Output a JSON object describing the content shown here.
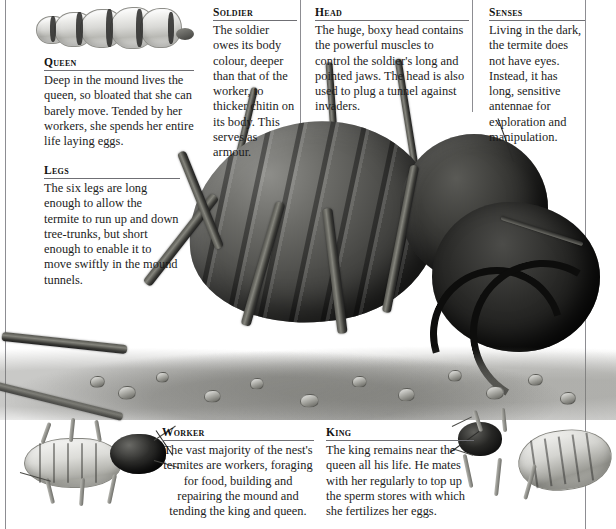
{
  "page": {
    "background_color": "#ffffff",
    "rule_color": "#8d8d92",
    "text_color": "#1c1c1c"
  },
  "captions": [
    {
      "id": "queen",
      "heading": "Queen",
      "body": "Deep in the mound lives the queen, so bloated that she can barely move. Tended by her workers, she spends her entire life laying eggs."
    },
    {
      "id": "legs",
      "heading": "Legs",
      "body": "The six legs are long enough to allow the termite to run up and down tree-trunks, but short enough to enable it to move swiftly in the mound tunnels."
    },
    {
      "id": "soldier",
      "heading": "Soldier",
      "body": "The soldier owes its body colour, deeper than that of the worker, to thicker chitin on its body. This serves as armour."
    },
    {
      "id": "head",
      "heading": "Head",
      "body": "The huge, boxy head contains the powerful muscles to control the soldier's long and pointed jaws. The head is also used to plug a tunnel against invaders."
    },
    {
      "id": "senses",
      "heading": "Senses",
      "body": "Living in the dark, the termite does not have eyes. Instead, it has long, sensitive antennae for exploration and manipulation."
    },
    {
      "id": "worker",
      "heading": "Worker",
      "body": "The vast majority of the nest's termites are workers, foraging for food, building and repairing the mound and tending the king and queen."
    },
    {
      "id": "king",
      "heading": "King",
      "body": "The king remains near the queen all his life. He mates with her regularly to top up the sperm stores with which she fertilizes her eggs."
    }
  ],
  "illustrations": [
    {
      "id": "queen-art",
      "name": "queen-termite-illustration"
    },
    {
      "id": "main-art",
      "name": "soldier-termite-illustration"
    },
    {
      "id": "worker-art",
      "name": "worker-termite-illustration"
    },
    {
      "id": "king-art",
      "name": "king-termite-illustration"
    }
  ]
}
